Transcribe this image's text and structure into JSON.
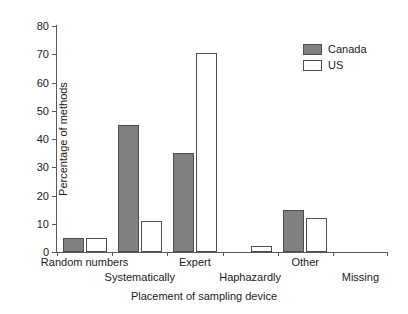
{
  "chart_data": {
    "type": "bar",
    "title": "",
    "xlabel": "Placement of sampling device",
    "ylabel": "Percentage of methods",
    "categories": [
      "Random numbers",
      "Systematically",
      "Expert",
      "Haphazardly",
      "Other",
      "Missing"
    ],
    "series": [
      {
        "name": "Canada",
        "values": [
          5,
          45,
          35,
          0,
          15,
          0
        ],
        "color": "#808080"
      },
      {
        "name": "US",
        "values": [
          5,
          11,
          70.5,
          2,
          12,
          0
        ],
        "color": "#ffffff"
      }
    ],
    "ylim": [
      0,
      80
    ],
    "yticks": [
      0,
      10,
      20,
      30,
      40,
      50,
      60,
      70,
      80
    ],
    "ytick_labels": [
      "0",
      "10",
      "20",
      "30",
      "40",
      "50",
      "60",
      "70",
      "80"
    ],
    "grid": false,
    "legend_position": "top-right",
    "legend_entries": [
      "Canada",
      "US"
    ]
  },
  "legend": {
    "canada_label": "Canada",
    "us_label": "US"
  },
  "axes": {
    "y_title": "Percentage of methods",
    "x_title": "Placement of sampling device"
  }
}
